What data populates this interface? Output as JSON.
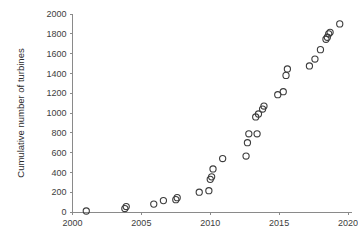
{
  "chart_data": {
    "type": "scatter",
    "title": "",
    "xlabel": "",
    "ylabel": "Cumulative number of turbines",
    "xlim": [
      2000,
      2020
    ],
    "ylim": [
      0,
      2000
    ],
    "xticks": [
      2000,
      2005,
      2010,
      2015,
      2020
    ],
    "yticks": [
      0,
      200,
      400,
      600,
      800,
      1000,
      1200,
      1400,
      1600,
      1800,
      2000
    ],
    "grid": false,
    "legend": null,
    "marker": "open-circle",
    "marker_color": "#3c3c3c",
    "series": [
      {
        "name": "Cumulative turbines",
        "points": [
          [
            2001.0,
            10
          ],
          [
            2003.8,
            35
          ],
          [
            2003.9,
            55
          ],
          [
            2005.9,
            80
          ],
          [
            2006.6,
            115
          ],
          [
            2007.5,
            125
          ],
          [
            2007.6,
            145
          ],
          [
            2009.2,
            200
          ],
          [
            2009.9,
            215
          ],
          [
            2010.0,
            330
          ],
          [
            2010.1,
            355
          ],
          [
            2010.2,
            435
          ],
          [
            2010.9,
            540
          ],
          [
            2012.6,
            565
          ],
          [
            2012.7,
            700
          ],
          [
            2012.8,
            790
          ],
          [
            2013.4,
            790
          ],
          [
            2013.3,
            960
          ],
          [
            2013.5,
            990
          ],
          [
            2013.8,
            1040
          ],
          [
            2013.9,
            1070
          ],
          [
            2014.9,
            1185
          ],
          [
            2015.3,
            1215
          ],
          [
            2015.5,
            1380
          ],
          [
            2015.6,
            1445
          ],
          [
            2017.2,
            1475
          ],
          [
            2017.6,
            1545
          ],
          [
            2018.0,
            1640
          ],
          [
            2018.4,
            1745
          ],
          [
            2018.5,
            1765
          ],
          [
            2018.6,
            1800
          ],
          [
            2018.7,
            1815
          ],
          [
            2019.4,
            1900
          ]
        ]
      }
    ]
  },
  "axes": {
    "y_title": "Cumulative number of turbines",
    "x_tick_labels": [
      "2000",
      "2005",
      "2010",
      "2015",
      "2020"
    ],
    "y_tick_labels": [
      "0",
      "200",
      "400",
      "600",
      "800",
      "1000",
      "1200",
      "1400",
      "1600",
      "1800",
      "2000"
    ]
  }
}
